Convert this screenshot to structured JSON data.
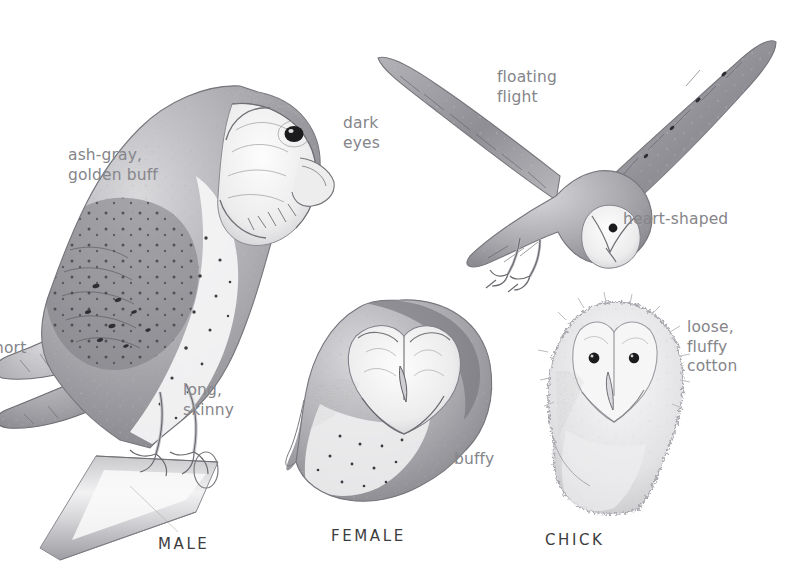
{
  "plate": {
    "title": "Barn Owl",
    "background_color": "#ffffff",
    "label_color": "#85858a",
    "caption_color": "#3d3d40",
    "ink_color": "#6e6e72"
  },
  "annotations": {
    "ash_gray": "ash-gray,\ngolden buff",
    "dark_eyes": "dark\neyes",
    "floating_flight": "floating\nflight",
    "heart_shaped": "heart-shaped",
    "short": "hort",
    "long_skinny": "long,\nskinny",
    "buffy": "buffy",
    "loose_fluffy": "loose,\nfluffy\ncotton"
  },
  "captions": {
    "male": "MALE",
    "female": "FEMALE",
    "chick": "CHICK"
  },
  "figures": [
    {
      "name": "perched-male-owl",
      "caption": "MALE",
      "pose": "perched in profile facing right on a diagonal wooden post"
    },
    {
      "name": "flying-owl",
      "caption": "",
      "pose": "floating flight, wings raised in a V, talons lowered"
    },
    {
      "name": "female-head",
      "caption": "FEMALE",
      "pose": "head and upper breast, three-quarter view"
    },
    {
      "name": "chick",
      "caption": "CHICK",
      "pose": "downy chick facing forward"
    }
  ]
}
